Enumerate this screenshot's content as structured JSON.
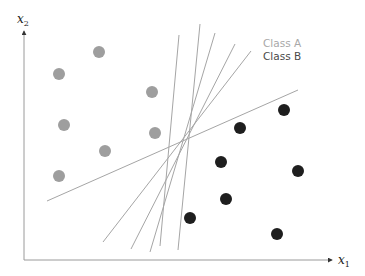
{
  "diagram": {
    "axes": {
      "x": {
        "label": "x",
        "subscript": "1"
      },
      "y": {
        "label": "x",
        "subscript": "2"
      },
      "color": "#9a9a9a"
    },
    "legend": [
      {
        "label": "Class A",
        "color": "#a8a8a8"
      },
      {
        "label": "Class B",
        "color": "#4a4a4a"
      }
    ],
    "class_a": {
      "color": "#9e9e9e",
      "points": [
        [
          99,
          52
        ],
        [
          59,
          74
        ],
        [
          152,
          92
        ],
        [
          64,
          125
        ],
        [
          105,
          151
        ],
        [
          155,
          133
        ],
        [
          59,
          176
        ]
      ]
    },
    "class_b": {
      "color": "#1e1e1e",
      "points": [
        [
          284,
          110
        ],
        [
          240,
          128
        ],
        [
          221,
          162
        ],
        [
          298,
          171
        ],
        [
          226,
          199
        ],
        [
          190,
          218
        ],
        [
          277,
          234
        ]
      ]
    },
    "separating_lines": {
      "color": "#a5a5a5",
      "lines": [
        [
          179,
          35,
          160,
          246
        ],
        [
          200,
          24,
          178,
          250
        ],
        [
          215,
          33,
          150,
          252
        ],
        [
          235,
          44,
          131,
          249
        ],
        [
          251,
          51,
          103,
          242
        ],
        [
          298,
          90,
          47,
          201
        ]
      ]
    }
  }
}
